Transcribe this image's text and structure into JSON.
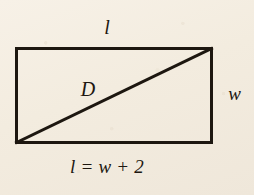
{
  "figure": {
    "kind": "geometry-diagram",
    "shape": "rectangle-with-diagonal",
    "background_color": "#f5efe4",
    "ink_color": "#1d1710",
    "labels": {
      "top_side": "l",
      "right_side": "w",
      "diagonal": "D",
      "equation": "l = w + 2"
    },
    "rectangle": {
      "left": 15,
      "top": 47,
      "right": 213,
      "bottom": 144,
      "stroke_width": 3
    },
    "diagonal": {
      "from_x": 15,
      "from_y": 144,
      "to_x": 213,
      "to_y": 47,
      "stroke_width": 3
    }
  }
}
